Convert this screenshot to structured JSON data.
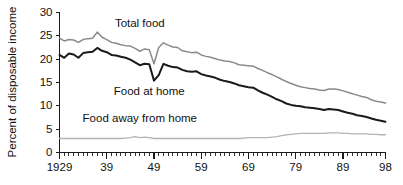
{
  "chart_data": {
    "type": "line",
    "title": "",
    "xlabel": "",
    "ylabel": "Percent of disposable income",
    "xlim": [
      1929,
      1998
    ],
    "ylim": [
      0,
      30
    ],
    "grid": false,
    "legend_position": "inline-annotations",
    "x_tick_labels": [
      "1929",
      "39",
      "49",
      "59",
      "69",
      "79",
      "89",
      "98"
    ],
    "x_tick_values": [
      1929,
      1939,
      1949,
      1959,
      1969,
      1979,
      1989,
      1998
    ],
    "x_minor_tick_step": 1,
    "y_tick_labels": [
      "0",
      "5",
      "10",
      "15",
      "20",
      "25",
      "30"
    ],
    "y_tick_values": [
      0,
      5,
      10,
      15,
      20,
      25,
      30
    ],
    "x": [
      1929,
      1930,
      1931,
      1932,
      1933,
      1934,
      1935,
      1936,
      1937,
      1938,
      1939,
      1940,
      1941,
      1942,
      1943,
      1944,
      1945,
      1946,
      1947,
      1948,
      1949,
      1950,
      1951,
      1952,
      1953,
      1954,
      1955,
      1956,
      1957,
      1958,
      1959,
      1960,
      1961,
      1962,
      1963,
      1964,
      1965,
      1966,
      1967,
      1968,
      1969,
      1970,
      1971,
      1972,
      1973,
      1974,
      1975,
      1976,
      1977,
      1978,
      1979,
      1980,
      1981,
      1982,
      1983,
      1984,
      1985,
      1986,
      1987,
      1988,
      1989,
      1990,
      1991,
      1992,
      1993,
      1994,
      1995,
      1996,
      1997,
      1998
    ],
    "series": [
      {
        "name": "Total food",
        "color": "#8a8a8a",
        "values": [
          24.5,
          23.9,
          24.2,
          24.1,
          23.6,
          24.2,
          24.4,
          24.5,
          25.8,
          24.7,
          24.2,
          23.6,
          23.4,
          23.1,
          22.9,
          22.8,
          22.3,
          21.7,
          22.2,
          22.0,
          19.0,
          22.5,
          23.5,
          23.0,
          22.6,
          22.5,
          21.8,
          21.6,
          21.4,
          21.5,
          20.9,
          20.6,
          20.4,
          20.1,
          19.8,
          19.6,
          19.5,
          19.2,
          18.8,
          18.7,
          18.6,
          18.5,
          18.0,
          17.6,
          17.1,
          16.7,
          16.2,
          15.7,
          15.2,
          14.8,
          14.4,
          14.1,
          13.9,
          13.7,
          13.6,
          13.4,
          13.3,
          13.6,
          13.6,
          13.5,
          13.2,
          12.9,
          12.6,
          12.3,
          12.0,
          11.8,
          11.3,
          11.0,
          10.8,
          10.6
        ]
      },
      {
        "name": "Food at home",
        "color": "#1a1a1a",
        "values": [
          20.9,
          20.3,
          21.2,
          21.0,
          20.3,
          21.3,
          21.5,
          21.6,
          22.4,
          21.8,
          21.5,
          20.9,
          20.8,
          20.5,
          20.3,
          19.9,
          19.3,
          18.7,
          19.0,
          18.9,
          15.4,
          16.6,
          19.0,
          18.6,
          18.3,
          18.2,
          17.7,
          17.4,
          17.3,
          17.4,
          16.8,
          16.5,
          16.3,
          16.0,
          15.6,
          15.3,
          15.1,
          14.8,
          14.4,
          14.2,
          14.0,
          13.9,
          13.3,
          12.8,
          12.4,
          11.9,
          11.4,
          11.0,
          10.5,
          10.2,
          10.0,
          9.9,
          9.7,
          9.6,
          9.5,
          9.3,
          9.1,
          9.3,
          9.2,
          9.1,
          8.8,
          8.5,
          8.3,
          8.0,
          7.8,
          7.6,
          7.3,
          7.0,
          6.8,
          6.6
        ]
      },
      {
        "name": "Food away from home",
        "color": "#b3b3b3",
        "values": [
          3.0,
          3.0,
          3.0,
          3.0,
          3.0,
          3.0,
          3.0,
          3.0,
          3.0,
          3.0,
          3.0,
          3.0,
          3.0,
          3.0,
          3.1,
          3.2,
          3.4,
          3.2,
          3.3,
          3.2,
          3.0,
          3.0,
          3.0,
          3.0,
          3.0,
          3.0,
          3.0,
          3.0,
          3.0,
          3.0,
          3.0,
          3.0,
          3.0,
          3.0,
          3.0,
          3.0,
          3.0,
          3.0,
          3.0,
          3.1,
          3.2,
          3.2,
          3.2,
          3.2,
          3.2,
          3.3,
          3.4,
          3.6,
          3.8,
          3.9,
          4.0,
          4.1,
          4.1,
          4.1,
          4.1,
          4.1,
          4.1,
          4.2,
          4.2,
          4.2,
          4.1,
          4.1,
          4.0,
          4.0,
          4.0,
          4.0,
          3.9,
          3.9,
          3.8,
          3.8
        ]
      }
    ],
    "annotations": [
      {
        "name": "total-food",
        "text": "Total food",
        "x": 1946,
        "y": 27.0
      },
      {
        "name": "food-at-home",
        "text": "Food at home",
        "x": 1948,
        "y": 12.3
      },
      {
        "name": "food-away-from-home",
        "text": "Food away from home",
        "x": 1946,
        "y": 6.6
      }
    ]
  }
}
